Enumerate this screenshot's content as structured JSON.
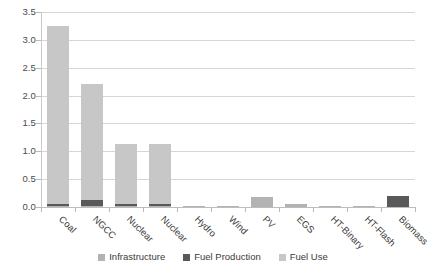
{
  "chart_data": {
    "type": "bar",
    "subtype": "stacked-column",
    "title": "",
    "xlabel": "",
    "ylabel": "",
    "ylim": [
      0.0,
      3.5
    ],
    "ytick_labels": [
      "0.0",
      "0.5",
      "1.0",
      "1.5",
      "2.0",
      "2.5",
      "3.0",
      "3.5"
    ],
    "ytick_values": [
      0.0,
      0.5,
      1.0,
      1.5,
      2.0,
      2.5,
      3.0,
      3.5
    ],
    "grid": true,
    "legend_position": "bottom",
    "categories": [
      "Coal",
      "NGCC",
      "Nuclear",
      "Nuclear",
      "Hydro",
      "Wind",
      "PV",
      "EGS",
      "HT-Binary",
      "HT-Flash",
      "Biomass"
    ],
    "series": [
      {
        "name": "Infrastructure",
        "color": "#b3b3b3",
        "values": [
          0.01,
          0.01,
          0.02,
          0.02,
          0.015,
          0.02,
          0.18,
          0.055,
          0.015,
          0.012,
          0.0
        ]
      },
      {
        "name": "Fuel Production",
        "color": "#595959",
        "values": [
          0.05,
          0.12,
          0.03,
          0.03,
          0.0,
          0.0,
          0.0,
          0.0,
          0.0,
          0.0,
          0.19
        ]
      },
      {
        "name": "Fuel Use",
        "color": "#c7c7c7",
        "values": [
          3.19,
          2.07,
          1.08,
          1.08,
          0.0,
          0.0,
          0.0,
          0.0,
          0.0,
          0.0,
          0.0
        ]
      }
    ],
    "totals": [
      3.25,
      2.2,
      1.13,
      1.13,
      0.015,
      0.02,
      0.18,
      0.055,
      0.015,
      0.012,
      0.19
    ]
  },
  "legend": {
    "items": [
      {
        "label": "Infrastructure",
        "color": "#b3b3b3"
      },
      {
        "label": "Fuel Production",
        "color": "#595959"
      },
      {
        "label": "Fuel Use",
        "color": "#c7c7c7"
      }
    ]
  }
}
